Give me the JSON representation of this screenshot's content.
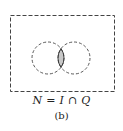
{
  "diagram": {
    "type": "venn",
    "universe": {
      "border": "dashed",
      "x": 10,
      "y": 15,
      "width": 105,
      "height": 77
    },
    "sets": [
      {
        "name": "I",
        "cx": 48,
        "cy": 58,
        "r": 16,
        "border": "dashed"
      },
      {
        "name": "Q",
        "cx": 74,
        "cy": 58,
        "r": 16,
        "border": "dashed"
      }
    ],
    "shaded_region": "intersection",
    "shade_color": "#c8c8c8",
    "stroke_color": "#333333"
  },
  "labels": {
    "formula": "N = I ∩ Q",
    "sublabel": "(b)"
  }
}
